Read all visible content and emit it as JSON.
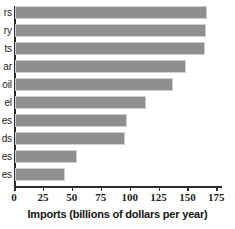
{
  "chart_data": {
    "type": "bar",
    "orientation": "horizontal",
    "title": "",
    "xlabel": "Imports (billions of dollars per year)",
    "ylabel": "",
    "xlim": [
      0,
      179
    ],
    "xticks": [
      0,
      25,
      50,
      75,
      100,
      125,
      150,
      175
    ],
    "xticklabels": [
      "0",
      "25",
      "50",
      "75",
      "100",
      "125",
      "150",
      "175"
    ],
    "grid": false,
    "legend": null,
    "bar_color": "#8e8e8e",
    "axis_color": "#2b2b2b",
    "categories": [
      "rs",
      "ry",
      "ts",
      "ar",
      "oil",
      "el",
      "es",
      "ds",
      "es",
      "es"
    ],
    "values": [
      166,
      165,
      164,
      148,
      137,
      113,
      97,
      95,
      54,
      43
    ],
    "note": "Category labels are cropped at the left edge of the image; only the trailing characters are visible."
  },
  "axis": {
    "x_title": "Imports (billions of dollars per year)"
  }
}
